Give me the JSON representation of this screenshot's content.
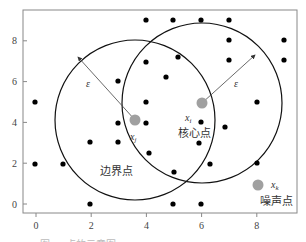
{
  "figure": {
    "type": "DBSCAN point-type illustration",
    "axes": {
      "x_ticks": [
        "0",
        "2",
        "4",
        "6",
        "8"
      ],
      "y_ticks": [
        "0",
        "2",
        "4",
        "6",
        "8"
      ],
      "xlim": [
        -0.5,
        9.4
      ],
      "ylim": [
        -0.4,
        9.5
      ]
    },
    "epsilon_symbol": "ε",
    "core_point": {
      "label": "x",
      "subscript": "i",
      "name": "核心点",
      "x": 6.0,
      "y": 4.9,
      "color": "#a0a0a0"
    },
    "border_point": {
      "label": "x",
      "subscript": "j",
      "name": "边界点",
      "x": 3.6,
      "y": 4.1,
      "color": "#a0a0a0"
    },
    "noise_point": {
      "label": "x",
      "subscript": "k",
      "name": "噪声点",
      "x": 8.0,
      "y": 0.9,
      "color": "#a0a0a0"
    },
    "epsilon_radius": 2.9,
    "points": [
      [
        4,
        9
      ],
      [
        5,
        9
      ],
      [
        6,
        9
      ],
      [
        7,
        9
      ],
      [
        7,
        8
      ],
      [
        9,
        8
      ],
      [
        7,
        7
      ],
      [
        9,
        7
      ],
      [
        5.2,
        7.2
      ],
      [
        4.8,
        6.3
      ],
      [
        3,
        6
      ],
      [
        0,
        5
      ],
      [
        4,
        5
      ],
      [
        8,
        5
      ],
      [
        3,
        4
      ],
      [
        4,
        4
      ],
      [
        6,
        4
      ],
      [
        7,
        3.8
      ],
      [
        2,
        3
      ],
      [
        3,
        3
      ],
      [
        5.9,
        3
      ],
      [
        6.3,
        2
      ],
      [
        4.1,
        2.5
      ],
      [
        5,
        1.6
      ],
      [
        8,
        2
      ],
      [
        0,
        2
      ],
      [
        1,
        2
      ],
      [
        2,
        0
      ],
      [
        5,
        0
      ],
      [
        6,
        0
      ]
    ],
    "caption": "图 … 点的示意图"
  }
}
